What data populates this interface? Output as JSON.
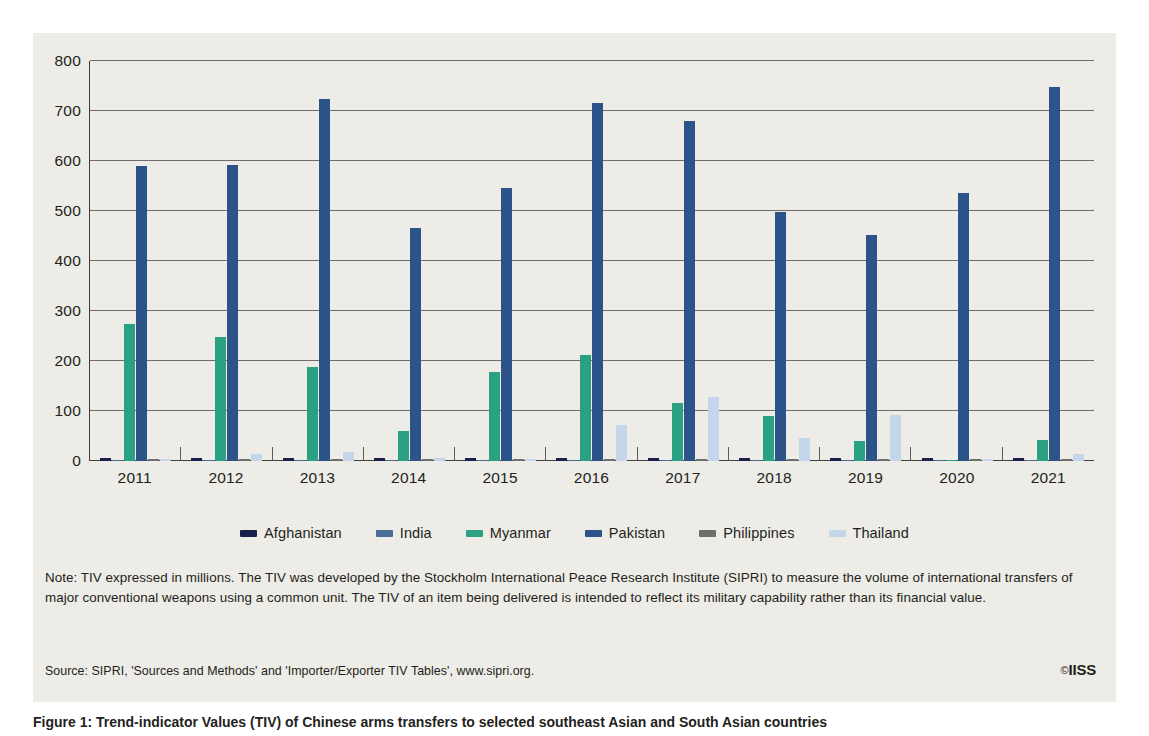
{
  "chart_data": {
    "type": "bar",
    "title": "",
    "xlabel": "",
    "ylabel": "",
    "ylim": [
      0,
      800
    ],
    "yticks": [
      0,
      100,
      200,
      300,
      400,
      500,
      600,
      700,
      800
    ],
    "grid": true,
    "legend_position": "bottom",
    "categories": [
      "2011",
      "2012",
      "2013",
      "2014",
      "2015",
      "2016",
      "2017",
      "2018",
      "2019",
      "2020",
      "2021"
    ],
    "series": [
      {
        "name": "Afghanistan",
        "color": "#1b1f4b",
        "values": [
          6,
          6,
          6,
          6,
          6,
          6,
          7,
          6,
          6,
          6,
          6
        ]
      },
      {
        "name": "India",
        "color": "#4a6c97",
        "values": [
          3,
          2,
          2,
          2,
          2,
          2,
          2,
          2,
          2,
          2,
          3
        ]
      },
      {
        "name": "Myanmar",
        "color": "#2aa183",
        "values": [
          275,
          249,
          188,
          60,
          179,
          213,
          116,
          90,
          41,
          2,
          43
        ]
      },
      {
        "name": "Pakistan",
        "color": "#2c5489",
        "values": [
          591,
          592,
          724,
          466,
          546,
          717,
          681,
          498,
          452,
          537,
          748
        ]
      },
      {
        "name": "Philippines",
        "color": "#6e6e6e",
        "values": [
          4,
          4,
          4,
          4,
          4,
          4,
          4,
          4,
          4,
          4,
          4
        ]
      },
      {
        "name": "Thailand",
        "color": "#c3d6ea",
        "values": [
          5,
          14,
          18,
          6,
          4,
          72,
          129,
          47,
          92,
          5,
          15
        ]
      }
    ]
  },
  "legend": {
    "items": [
      {
        "label": "Afghanistan",
        "color": "#1b1f4b"
      },
      {
        "label": "India",
        "color": "#4a6c97"
      },
      {
        "label": "Myanmar",
        "color": "#2aa183"
      },
      {
        "label": "Pakistan",
        "color": "#2c5489"
      },
      {
        "label": "Philippines",
        "color": "#6e6e6e"
      },
      {
        "label": "Thailand",
        "color": "#c3d6ea"
      }
    ]
  },
  "note": {
    "text": "Note: TIV expressed in millions. The TIV was developed by the Stockholm International Peace Research Institute (SIPRI) to measure the volume of international transfers of major conventional weapons using a common unit. The TIV of an item being delivered is intended to reflect its military capability rather than its financial value."
  },
  "source": {
    "text": "Source: SIPRI, 'Sources and Methods' and 'Importer/Exporter TIV Tables', www.sipri.org."
  },
  "logo": {
    "copyright": "©",
    "name": "IISS"
  },
  "caption": {
    "text": "Figure 1: Trend-indicator Values (TIV) of Chinese arms transfers to selected southeast Asian and South Asian countries"
  },
  "colors": {
    "panel_background": "#edece6",
    "axis": "#3f3f3f",
    "gridline": "#6d6d6d",
    "text": "#231f20"
  }
}
